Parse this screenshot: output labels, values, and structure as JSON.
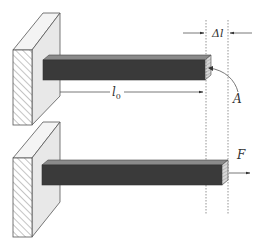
{
  "diagram": {
    "type": "mechanics-tension-elongation",
    "labels": {
      "delta_l": "Δl",
      "l0_main": "l",
      "l0_sub": "0",
      "area": "A",
      "force": "F"
    },
    "elements": [
      {
        "name": "top-wall",
        "description": "fixed support with hatched face"
      },
      {
        "name": "top-bar",
        "description": "unstretched bar of original length l0"
      },
      {
        "name": "bottom-wall",
        "description": "fixed support with hatched face"
      },
      {
        "name": "bottom-bar",
        "description": "bar stretched by delta l under force F"
      },
      {
        "name": "reference-lines",
        "description": "two dotted vertical lines marking delta l"
      }
    ],
    "colors": {
      "bar_front": "#3a3a3a",
      "bar_top": "#8a8a8a",
      "wall_side": "#e8e8e8",
      "wall_top": "#f4f4f4",
      "outline": "#555555",
      "hatch": "#888888",
      "dotted": "#888888"
    }
  }
}
